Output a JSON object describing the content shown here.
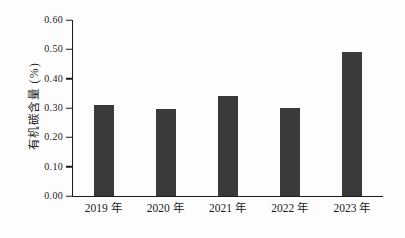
{
  "chart_data": {
    "type": "bar",
    "title": "",
    "xlabel": "",
    "ylabel": "有机碳含量 (%)",
    "categories": [
      "2019 年",
      "2020 年",
      "2021 年",
      "2022 年",
      "2023 年"
    ],
    "values": [
      0.31,
      0.295,
      0.34,
      0.3,
      0.49
    ],
    "ylim": [
      0.0,
      0.6
    ],
    "ytick_step": 0.1,
    "ytick_labels": [
      "0.00",
      "0.10",
      "0.20",
      "0.30",
      "0.40",
      "0.50",
      "0.60"
    ],
    "grid": false,
    "legend": null,
    "bar_color": "#3a3a3a",
    "axis_color": "#1a1a1a",
    "background_color": "#fdfdfd"
  }
}
